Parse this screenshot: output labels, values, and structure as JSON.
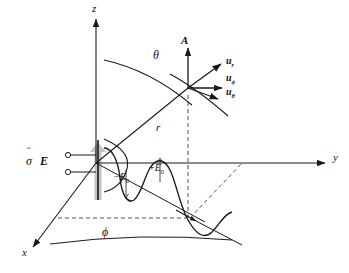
{
  "figure": {
    "type": "physics-vector-diagram",
    "background_color": "#ffffff",
    "line_color": "#1a1a1a",
    "gray_color": "#b4b4b4",
    "dash_color": "#555555"
  },
  "axes": [
    {
      "id": "z",
      "label": "z",
      "x": 96,
      "y": 8,
      "description": "vertical axis pointing up"
    },
    {
      "id": "y",
      "label": "y",
      "x": 336,
      "y": 158,
      "description": "horizontal axis pointing right"
    },
    {
      "id": "x",
      "label": "x",
      "x": 26,
      "y": 253,
      "description": "axis pointing down-left toward viewer"
    }
  ],
  "angles": [
    {
      "id": "theta",
      "label": "θ",
      "x": 156,
      "y": 55,
      "description": "polar angle from z axis"
    },
    {
      "id": "phi",
      "label": "ϕ",
      "x": 105,
      "y": 233,
      "description": "azimuthal angle in xy plane"
    }
  ],
  "radial": {
    "label": "r",
    "x": 158,
    "y": 128,
    "description": "radial distance to observation point"
  },
  "vectors": [
    {
      "id": "A",
      "label": "A",
      "x": 184,
      "y": 42,
      "bold": true,
      "description": "magnetic vector potential, points up"
    },
    {
      "id": "u_r",
      "label": "u",
      "sub": "r",
      "x": 228,
      "y": 62,
      "bold": true,
      "description": "radial unit vector"
    },
    {
      "id": "u_phi",
      "label": "u",
      "sub": "ϕ",
      "x": 228,
      "y": 79,
      "bold": true,
      "description": "azimuthal unit vector"
    },
    {
      "id": "u_theta",
      "label": "u",
      "sub": "θ",
      "x": 228,
      "y": 93,
      "bold": true,
      "description": "polar unit vector"
    }
  ],
  "source": {
    "sigma_label": "σ",
    "sigma_hat": "ˆ",
    "e_label": "E",
    "x": 28,
    "y": 162,
    "description": "conductivity-hat and E field source label at feed terminals"
  },
  "field_labels": [
    {
      "id": "minus-E0",
      "sign": "−",
      "symbol": "E",
      "sub": "0",
      "x": 118,
      "y": 177,
      "description": "negative field amplitude"
    },
    {
      "id": "plus-E0",
      "sign": "+",
      "symbol": "E",
      "sub": "0",
      "x": 152,
      "y": 170,
      "description": "positive field amplitude"
    }
  ],
  "origin": {
    "x": 96,
    "y": 163
  },
  "observation_point": {
    "x": 188,
    "y": 88
  }
}
